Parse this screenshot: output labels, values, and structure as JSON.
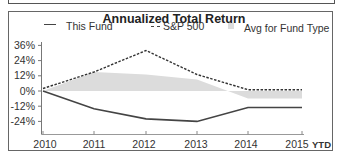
{
  "chart_data": {
    "type": "line",
    "title": "Annualized Total Return",
    "xlabel": "",
    "ylabel": "",
    "categories": [
      "2010",
      "2011",
      "2012",
      "2013",
      "2014",
      "2015"
    ],
    "x_suffix_label": "YTD",
    "y_ticks": [
      "36%",
      "24%",
      "12%",
      "0%",
      "-12%",
      "-24%"
    ],
    "ylim": [
      -30,
      40
    ],
    "grid": false,
    "legend_position": "top",
    "series": [
      {
        "name": "This Fund",
        "style": "solid",
        "values": [
          0,
          -14,
          -22,
          -24,
          -13,
          -13
        ]
      },
      {
        "name": "S&P 500",
        "style": "dashed",
        "values": [
          2,
          15,
          32,
          13,
          1,
          1
        ]
      },
      {
        "name": "Avg for Fund Type",
        "style": "area",
        "values": [
          0,
          15,
          13,
          9,
          -6,
          -6
        ]
      }
    ]
  },
  "legend": {
    "this_fund": "This Fund",
    "sp500": "S&P 500",
    "avg": "Avg for Fund Type"
  },
  "colors": {
    "fund_line": "#444444",
    "sp500_line": "#333333",
    "avg_fill": "#dcdcdc"
  }
}
